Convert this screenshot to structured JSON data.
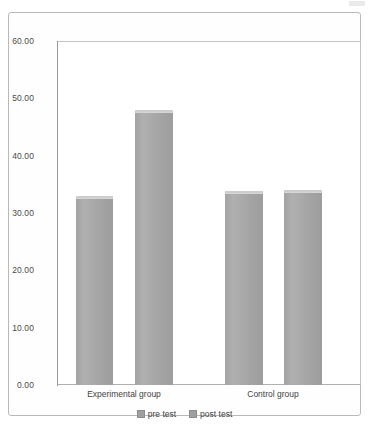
{
  "chart_data": {
    "type": "bar",
    "title": "",
    "xlabel": "",
    "ylabel": "",
    "categories": [
      "Experimental group",
      "Control group"
    ],
    "series": [
      {
        "name": "pre test",
        "values": [
          32.7,
          33.5
        ]
      },
      {
        "name": "post test",
        "values": [
          47.6,
          33.6
        ]
      }
    ],
    "ylim": [
      0,
      60
    ],
    "y_ticks": [
      {
        "value": 60,
        "label": "60.00"
      },
      {
        "value": 50,
        "label": "50.00"
      },
      {
        "value": 40,
        "label": "40.00"
      },
      {
        "value": 30,
        "label": "30.00"
      },
      {
        "value": 20,
        "label": "20.00"
      },
      {
        "value": 10,
        "label": "10.00"
      },
      {
        "value": 0,
        "label": "0.00"
      }
    ],
    "grid": false,
    "legend_position": "bottom",
    "bar_color": "#a6a6a6",
    "axis_color": "#9a9a9a",
    "plot_background": "#ffffff"
  },
  "legend": {
    "items": [
      {
        "label": "pre test"
      },
      {
        "label": "post test"
      }
    ]
  },
  "axis": {
    "tick_labels": [
      "60.00",
      "50.00",
      "40.00",
      "30.00",
      "20.00",
      "10.00",
      "0.00"
    ]
  },
  "categories": {
    "labels": [
      "Experimental group",
      "Control group"
    ]
  }
}
